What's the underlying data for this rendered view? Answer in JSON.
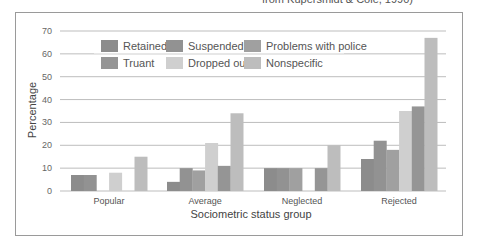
{
  "source_note": "from Kupersmidt & Coie, 1990)",
  "chart_data": {
    "type": "bar",
    "title": "",
    "xlabel": "Sociometric status group",
    "ylabel": "Percentage",
    "ylim": [
      0,
      70
    ],
    "yticks": [
      0,
      10,
      20,
      30,
      40,
      50,
      60,
      70
    ],
    "grid": true,
    "legend_position": "top-left",
    "categories": [
      "Popular",
      "Average",
      "Neglected",
      "Rejected"
    ],
    "series": [
      {
        "name": "Retained",
        "color": "#8c8c8c",
        "values": [
          7,
          4,
          10,
          14
        ]
      },
      {
        "name": "Suspended",
        "color": "#929292",
        "values": [
          7,
          10,
          10,
          22
        ]
      },
      {
        "name": "Problems with police",
        "color": "#a0a0a0",
        "values": [
          0,
          9,
          10,
          18
        ]
      },
      {
        "name": "Dropped out",
        "color": "#cfcfcf",
        "values": [
          8,
          21,
          0,
          35
        ]
      },
      {
        "name": "Truant",
        "color": "#959595",
        "values": [
          0,
          11,
          10,
          37
        ]
      },
      {
        "name": "Nonspecific",
        "color": "#bdbdbd",
        "values": [
          15,
          34,
          20,
          67
        ]
      }
    ],
    "legend_order": [
      "Retained",
      "Suspended",
      "Problems with police",
      "Truant",
      "Dropped out",
      "Nonspecific"
    ]
  }
}
